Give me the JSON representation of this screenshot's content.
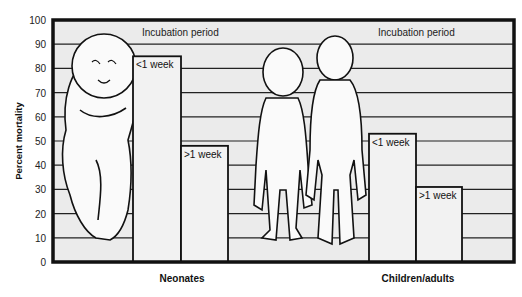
{
  "chart_data": {
    "type": "bar",
    "title": "",
    "xlabel": "",
    "ylabel": "Percent mortality",
    "ylim": [
      0,
      100
    ],
    "yticks": [
      0,
      10,
      20,
      30,
      40,
      50,
      60,
      70,
      80,
      90,
      100
    ],
    "grid": true,
    "groups": [
      "Neonates",
      "Children/adults"
    ],
    "group_annotation": "Incubation period",
    "series": [
      {
        "name": "<1 week",
        "values": [
          85,
          53
        ]
      },
      {
        "name": ">1 week",
        "values": [
          48,
          31
        ]
      }
    ],
    "bars": [
      {
        "group": "Neonates",
        "label": "<1 week",
        "value": 85
      },
      {
        "group": "Neonates",
        "label": ">1 week",
        "value": 48
      },
      {
        "group": "Children/adults",
        "label": "<1 week",
        "value": 53
      },
      {
        "group": "Children/adults",
        "label": ">1 week",
        "value": 31
      }
    ],
    "illustrations": [
      "infant-figure",
      "child-figure",
      "adult-figure"
    ],
    "colors": {
      "background": "#ebebeb",
      "bar_fill": "#f2f2f2",
      "frame": "#111111",
      "grid": "#222222"
    }
  },
  "labels": {
    "ylabel": "Percent mortality",
    "annotation_left": "Incubation period",
    "annotation_right": "Incubation period",
    "group_left": "Neonates",
    "group_right": "Children/adults",
    "bar1": "<1 week",
    "bar2": ">1 week",
    "bar3": "<1 week",
    "bar4": ">1 week",
    "ticks": [
      "0",
      "10",
      "20",
      "30",
      "40",
      "50",
      "60",
      "70",
      "80",
      "90",
      "100"
    ]
  }
}
